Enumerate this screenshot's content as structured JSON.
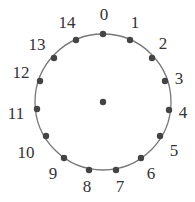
{
  "diagram": {
    "title": "",
    "circle": {
      "cx": 103,
      "cy": 102,
      "r": 68,
      "stroke": "#777777"
    },
    "center_dot": {
      "x": 103,
      "y": 102
    },
    "dot_color": "#444444",
    "nodes": [
      {
        "label": "0",
        "x": 103,
        "y": 34,
        "lx": 104,
        "ly": 14
      },
      {
        "label": "1",
        "x": 130,
        "y": 40,
        "lx": 135,
        "ly": 22
      },
      {
        "label": "2",
        "x": 152,
        "y": 58,
        "lx": 163,
        "ly": 43
      },
      {
        "label": "3",
        "x": 165,
        "y": 81,
        "lx": 179,
        "ly": 78
      },
      {
        "label": "4",
        "x": 169,
        "y": 110,
        "lx": 183,
        "ly": 112
      },
      {
        "label": "5",
        "x": 160,
        "y": 136,
        "lx": 174,
        "ly": 150
      },
      {
        "label": "6",
        "x": 141,
        "y": 158,
        "lx": 151,
        "ly": 173
      },
      {
        "label": "7",
        "x": 116,
        "y": 170,
        "lx": 120,
        "ly": 186
      },
      {
        "label": "8",
        "x": 89,
        "y": 170,
        "lx": 87,
        "ly": 186
      },
      {
        "label": "9",
        "x": 64,
        "y": 158,
        "lx": 53,
        "ly": 173
      },
      {
        "label": "10",
        "x": 46,
        "y": 136,
        "lx": 26,
        "ly": 152
      },
      {
        "label": "11",
        "x": 37,
        "y": 109,
        "lx": 16,
        "ly": 113
      },
      {
        "label": "12",
        "x": 40,
        "y": 81,
        "lx": 21,
        "ly": 72
      },
      {
        "label": "13",
        "x": 54,
        "y": 58,
        "lx": 37,
        "ly": 44
      },
      {
        "label": "14",
        "x": 76,
        "y": 40,
        "lx": 67,
        "ly": 22
      }
    ]
  }
}
